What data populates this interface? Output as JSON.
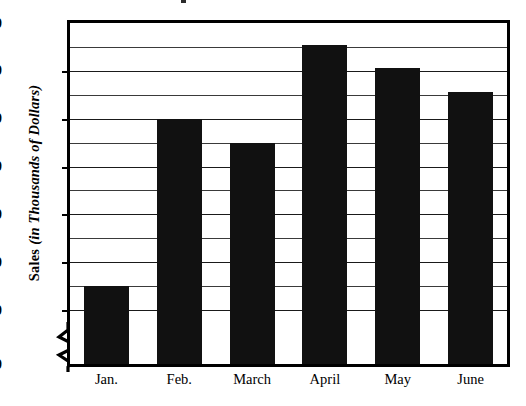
{
  "chart_data": {
    "type": "bar",
    "title": "",
    "xlabel": "",
    "ylabel": "Sales (in Thousands of Dollars)",
    "ylabel_main": "Sales",
    "ylabel_sub": "(in Thousands of Dollars)",
    "categories": [
      "Jan.",
      "Feb.",
      "March",
      "April",
      "May",
      "June"
    ],
    "values": [
      45,
      80,
      75,
      95.5,
      90.5,
      85.5
    ],
    "ylim": [
      0,
      100
    ],
    "axis_break": true,
    "axis_break_between": [
      0,
      40
    ],
    "grid": true,
    "grid_orientation": "horizontal",
    "legend": "none",
    "bar_color": "#111111",
    "major_ticks": [
      0,
      40,
      50,
      60,
      70,
      80,
      90,
      100
    ],
    "minor_gridlines": [
      45,
      55,
      65,
      75,
      85,
      95
    ],
    "tick_labels": [
      "0",
      "40",
      "50",
      "60",
      "70",
      "80",
      "90",
      "100"
    ]
  }
}
